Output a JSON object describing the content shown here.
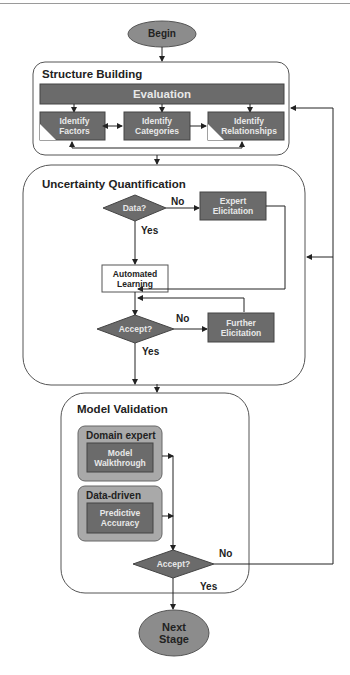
{
  "diagram": {
    "start": {
      "label": "Begin"
    },
    "end": {
      "label": "Next\nStage"
    },
    "groups": [
      {
        "title": "Structure Building",
        "nodes": [
          {
            "id": "evaluation",
            "label": "Evaluation"
          },
          {
            "id": "identify-factors",
            "label": "Identify\nFactors"
          },
          {
            "id": "identify-categories",
            "label": "Identify\nCategories"
          },
          {
            "id": "identify-relationships",
            "label": "Identify\nRelationships"
          }
        ]
      },
      {
        "title": "Uncertainty Quantification",
        "nodes": [
          {
            "id": "data-decision",
            "label": "Data?"
          },
          {
            "id": "expert-elicitation",
            "label": "Expert\nElicitation"
          },
          {
            "id": "automated-learning",
            "label": "Automated\nLearning"
          },
          {
            "id": "accept-decision-1",
            "label": "Accept?"
          },
          {
            "id": "further-elicitation",
            "label": "Further\nElicitation"
          }
        ],
        "edge_labels": {
          "data_no": "No",
          "data_yes": "Yes",
          "accept_no": "No",
          "accept_yes": "Yes"
        }
      },
      {
        "title": "Model Validation",
        "subgroups": [
          {
            "title": "Domain expert",
            "node": {
              "id": "model-walkthrough",
              "label": "Model\nWalkthrough"
            }
          },
          {
            "title": "Data-driven",
            "node": {
              "id": "predictive-accuracy",
              "label": "Predictive\nAccuracy"
            }
          }
        ],
        "nodes": [
          {
            "id": "accept-decision-2",
            "label": "Accept?"
          }
        ],
        "edge_labels": {
          "accept_no": "No",
          "accept_yes": "Yes"
        }
      }
    ],
    "colors": {
      "node_dark": "#6b6b6b",
      "terminal": "#8c8c8c",
      "subgroup": "#a9a9a9",
      "line": "#333333",
      "group_border": "#555555"
    }
  }
}
